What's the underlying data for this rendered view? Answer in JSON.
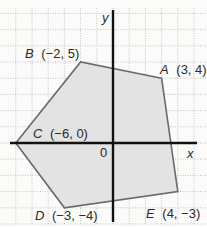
{
  "figure": {
    "type": "coordinate-plane-polygon",
    "axes": {
      "x_label": "x",
      "y_label": "y",
      "origin_label": "0",
      "x_range": [
        -7,
        5
      ],
      "y_range": [
        -5,
        8
      ]
    },
    "colors": {
      "fill": "#e3e3e3",
      "edge": "#6a6a6a",
      "axis": "#111111",
      "grid": "#b5b5b5"
    },
    "vertices": [
      {
        "name": "A",
        "x": 3,
        "y": 4,
        "coords": "(3, 4)"
      },
      {
        "name": "B",
        "x": -2,
        "y": 5,
        "coords": "(−2, 5)"
      },
      {
        "name": "C",
        "x": -6,
        "y": 0,
        "coords": "(−6, 0)"
      },
      {
        "name": "D",
        "x": -3,
        "y": -4,
        "coords": "(−3, −4)"
      },
      {
        "name": "E",
        "x": 4,
        "y": -3,
        "coords": "(4, −3)"
      }
    ]
  }
}
